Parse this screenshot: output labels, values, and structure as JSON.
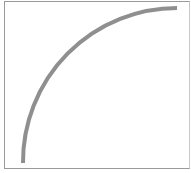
{
  "diagram": {
    "type": "quarter-circle-arc",
    "frame": {
      "x": 4,
      "y": 1,
      "width": 185,
      "height": 167,
      "border_color": "#9a9a9a"
    },
    "arc": {
      "start": {
        "x": 23,
        "y": 163
      },
      "end": {
        "x": 177,
        "y": 8
      },
      "radius": 154,
      "stroke_color": "#8f8f8f",
      "stroke_width": 4
    }
  }
}
